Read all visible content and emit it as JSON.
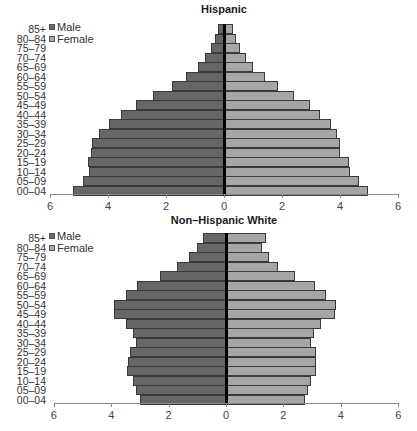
{
  "chart_data": [
    {
      "type": "bar",
      "orientation": "horizontal",
      "subtype": "population-pyramid",
      "title": "Hispanic",
      "xlabel": "",
      "ylabel": "",
      "xlim": [
        -6,
        6
      ],
      "xticks": [
        "6",
        "4",
        "2",
        "0",
        "2",
        "4",
        "6"
      ],
      "grid": false,
      "legend": {
        "position": "top-left",
        "entries": [
          "Male",
          "Female"
        ]
      },
      "categories": [
        "85+",
        "80–84",
        "75–79",
        "70–74",
        "65–69",
        "60–64",
        "55–59",
        "50–54",
        "45–49",
        "40–44",
        "35–39",
        "30–34",
        "25–29",
        "20–24",
        "15–19",
        "10–14",
        "05–09",
        "00–04"
      ],
      "series": [
        {
          "name": "Male",
          "color": "#666666",
          "values": [
            0.2,
            0.3,
            0.45,
            0.65,
            0.9,
            1.3,
            1.8,
            2.45,
            3.05,
            3.55,
            3.95,
            4.3,
            4.55,
            4.6,
            4.7,
            4.65,
            4.85,
            5.2
          ]
        },
        {
          "name": "Female",
          "color": "#a6a6a6",
          "values": [
            0.3,
            0.4,
            0.55,
            0.75,
            1.0,
            1.4,
            1.85,
            2.4,
            2.95,
            3.3,
            3.7,
            3.9,
            4.0,
            4.0,
            4.3,
            4.35,
            4.65,
            4.95
          ]
        }
      ]
    },
    {
      "type": "bar",
      "orientation": "horizontal",
      "subtype": "population-pyramid",
      "title": "Non–Hispanic White",
      "xlabel": "",
      "ylabel": "",
      "xlim": [
        -6,
        6
      ],
      "xticks": [
        "6",
        "4",
        "2",
        "0",
        "2",
        "4",
        "6"
      ],
      "grid": false,
      "legend": {
        "position": "top-left",
        "entries": [
          "Male",
          "Female"
        ]
      },
      "categories": [
        "85+",
        "80–84",
        "75–79",
        "70–74",
        "65–69",
        "60–64",
        "55–59",
        "50–54",
        "45–49",
        "40–44",
        "35–39",
        "30–34",
        "25–29",
        "20–24",
        "15–19",
        "10–14",
        "05–09",
        "00–04"
      ],
      "series": [
        {
          "name": "Male",
          "color": "#666666",
          "values": [
            0.8,
            1.0,
            1.3,
            1.7,
            2.3,
            3.1,
            3.5,
            3.9,
            3.9,
            3.5,
            3.25,
            3.15,
            3.35,
            3.4,
            3.45,
            3.25,
            3.15,
            3.0
          ]
        },
        {
          "name": "Female",
          "color": "#a6a6a6",
          "values": [
            1.4,
            1.25,
            1.5,
            1.8,
            2.4,
            3.1,
            3.5,
            3.85,
            3.8,
            3.3,
            3.05,
            2.95,
            3.15,
            3.15,
            3.15,
            2.95,
            2.85,
            2.75
          ]
        }
      ]
    }
  ]
}
